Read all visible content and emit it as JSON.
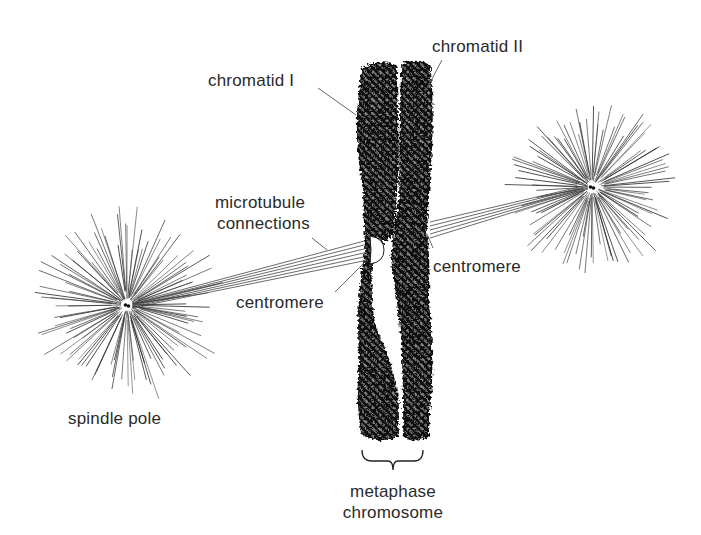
{
  "diagram": {
    "type": "biology-illustration",
    "colors": {
      "background": "#ffffff",
      "ink": "#1a1a1a",
      "label_text": "#2a2a2a",
      "leader_line": "#555555"
    },
    "labels": {
      "chromatid_1": "chromatid I",
      "chromatid_2": "chromatid II",
      "microtubule_line1": "microtubule",
      "microtubule_line2": "connections",
      "centromere_left": "centromere",
      "centromere_right": "centromere",
      "spindle_pole": "spindle pole",
      "metaphase_line1": "metaphase",
      "metaphase_line2": "chromosome"
    },
    "components": [
      {
        "name": "left-spindle-pole",
        "center": [
          127,
          305
        ]
      },
      {
        "name": "right-spindle-pole",
        "center": [
          592,
          187
        ]
      },
      {
        "name": "chromatid-I",
        "x_range": [
          355,
          400
        ],
        "y_range": [
          65,
          440
        ]
      },
      {
        "name": "chromatid-II",
        "x_range": [
          398,
          432
        ],
        "y_range": [
          62,
          438
        ]
      },
      {
        "name": "centromere-left",
        "at": [
          375,
          250
        ]
      },
      {
        "name": "centromere-right",
        "at": [
          425,
          230
        ]
      }
    ]
  }
}
